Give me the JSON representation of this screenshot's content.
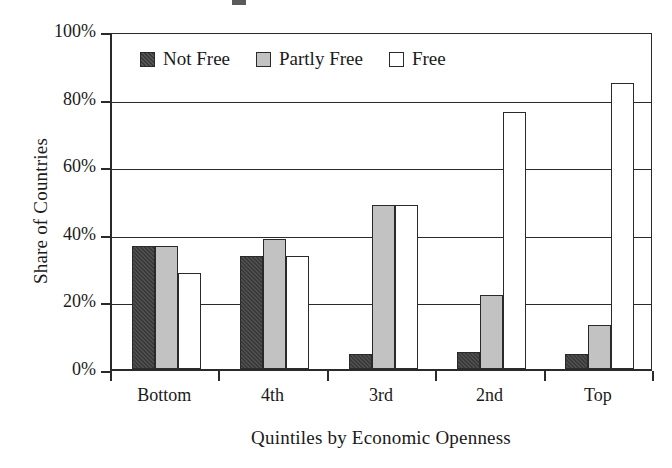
{
  "chart_data": {
    "type": "bar",
    "title": "",
    "xlabel": "Quintiles by Economic Openness",
    "ylabel": "Share of Countries",
    "categories": [
      "Bottom",
      "4th",
      "3rd",
      "2nd",
      "Top"
    ],
    "series": [
      {
        "name": "Not Free",
        "values": [
          36.5,
          33.5,
          4.3,
          5.0,
          4.5
        ],
        "color": "#3a3a3a",
        "fill": "dark-hatched"
      },
      {
        "name": "Partly Free",
        "values": [
          36.5,
          38.5,
          48.5,
          22.0,
          13.0
        ],
        "color": "#c2c2c2",
        "fill": "gray"
      },
      {
        "name": "Free",
        "values": [
          28.5,
          33.5,
          48.5,
          76.0,
          84.5
        ],
        "color": "#ffffff",
        "fill": "white"
      }
    ],
    "ylim": [
      0,
      100
    ],
    "ytick_labels": [
      "0%",
      "20%",
      "40%",
      "60%",
      "80%",
      "100%"
    ],
    "ytick_values": [
      0,
      20,
      40,
      60,
      80,
      100
    ],
    "grid": "horizontal",
    "legend_position": "inside-top-left",
    "value_suffix": "%"
  }
}
